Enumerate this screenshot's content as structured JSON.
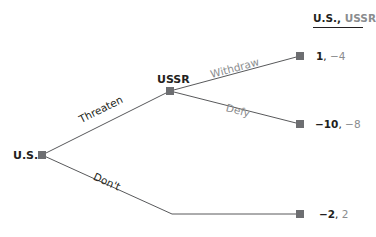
{
  "header": {
    "player1": "U.S.",
    "separator": ",",
    "player2": "USSR"
  },
  "nodes": {
    "root": {
      "label": "U.S."
    },
    "ussr": {
      "label": "USSR"
    }
  },
  "edges": {
    "threaten": "Threaten",
    "dont": "Don't",
    "withdraw": "Withdraw",
    "defy": "Defy"
  },
  "payoffs": [
    {
      "us": "1",
      "sep": ", ",
      "ussr": "−4"
    },
    {
      "us": "−10",
      "sep": ", ",
      "ussr": "−8"
    },
    {
      "us": "−2",
      "sep": ", ",
      "ussr": "2"
    }
  ],
  "colors": {
    "line": "#58595b",
    "node": "#6d6e71",
    "dark_text": "#231f20",
    "gray_text": "#8a8c8e"
  }
}
